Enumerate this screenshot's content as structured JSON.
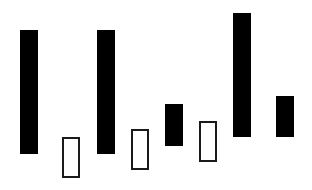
{
  "chart_data": {
    "type": "bar",
    "subtype": "floating-bars",
    "title": "",
    "xlabel": "",
    "ylabel": "",
    "grid": false,
    "legend": null,
    "canvas": {
      "width": 312,
      "height": 190
    },
    "colors": {
      "filled": "#000000",
      "hollow_border": "#1a1a1a",
      "hollow_fill": "#ffffff",
      "background": "#ffffff"
    },
    "bars": [
      {
        "index": 1,
        "style": "filled",
        "x": 20,
        "width": 18,
        "top": 30,
        "bottom": 154
      },
      {
        "index": 2,
        "style": "hollow",
        "x": 62,
        "width": 18,
        "top": 137,
        "bottom": 178
      },
      {
        "index": 3,
        "style": "filled",
        "x": 97,
        "width": 18,
        "top": 30,
        "bottom": 154
      },
      {
        "index": 4,
        "style": "hollow",
        "x": 131,
        "width": 18,
        "top": 129,
        "bottom": 170
      },
      {
        "index": 5,
        "style": "filled",
        "x": 165,
        "width": 18,
        "top": 104,
        "bottom": 146
      },
      {
        "index": 6,
        "style": "hollow",
        "x": 199,
        "width": 18,
        "top": 121,
        "bottom": 162
      },
      {
        "index": 7,
        "style": "filled",
        "x": 233,
        "width": 18,
        "top": 13,
        "bottom": 137
      },
      {
        "index": 8,
        "style": "filled",
        "x": 276,
        "width": 18,
        "top": 96,
        "bottom": 137
      }
    ]
  }
}
